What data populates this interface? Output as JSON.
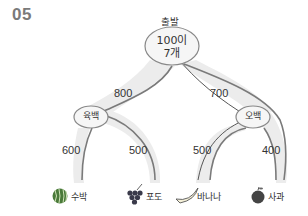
{
  "problem_number": "05",
  "diagram": {
    "type": "tree",
    "start_label": "출발",
    "root": {
      "line1": "100이",
      "line2": "7개"
    },
    "branches": [
      {
        "label": "800",
        "to": "육백"
      },
      {
        "label": "700",
        "to": "오백"
      }
    ],
    "nodes": {
      "left": "육백",
      "right": "오백"
    },
    "leaf_edges": [
      {
        "label": "600",
        "to": "수박"
      },
      {
        "label": "500",
        "to": "포도"
      },
      {
        "label": "500",
        "to": "바나나"
      },
      {
        "label": "400",
        "to": "사과"
      }
    ],
    "fruits": [
      {
        "name": "수박",
        "icon": "watermelon-icon"
      },
      {
        "name": "포도",
        "icon": "grapes-icon"
      },
      {
        "name": "바나나",
        "icon": "banana-icon"
      },
      {
        "name": "사과",
        "icon": "apple-icon"
      }
    ],
    "colors": {
      "path_fill": "#ececec",
      "path_edge": "#7a7a7a",
      "ellipse_fill": "#f4f4f4",
      "pen_line": "#444444"
    }
  }
}
